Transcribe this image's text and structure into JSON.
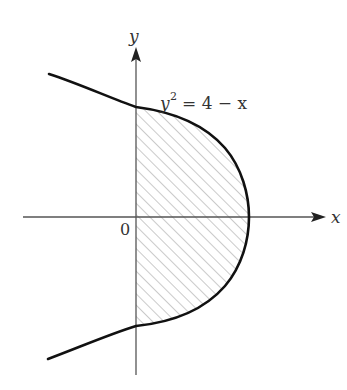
{
  "figure": {
    "type": "region-between-curve-and-axis",
    "curve_equation": "y^2 = 4 - x",
    "equation_label": {
      "lhs_base": "y",
      "lhs_exp": "2",
      "rhs": "= 4 − x"
    },
    "axes": {
      "x_label": "x",
      "y_label": "y",
      "origin_label": "0"
    },
    "shaded_region": {
      "description": "Region bounded by the parabola x = 4 - y^2 and the y-axis, for x >= 0",
      "fill": "diagonal-hatch",
      "x_range": [
        0,
        4
      ],
      "y_range": [
        -2,
        2
      ]
    },
    "key_points": {
      "vertex": [
        4,
        0
      ],
      "y_intercepts": [
        [
          0,
          2
        ],
        [
          0,
          -2
        ]
      ]
    },
    "colors": {
      "curve": "#111111",
      "axes": "#555555",
      "hatch": "#8a8a8a",
      "text": "#333333"
    }
  }
}
